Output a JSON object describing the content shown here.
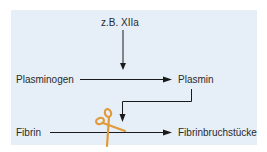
{
  "diagram": {
    "type": "fibrinolysis-pathway",
    "colors": {
      "background": "#e6eff8",
      "line": "#1a1a1a",
      "text": "#2a2a2a",
      "scissors": "#e09a3a"
    },
    "nodes": {
      "activator": "z.B. XIIa",
      "precursor": "Plasminogen",
      "enzyme": "Plasmin",
      "substrate": "Fibrin",
      "product": "Fibrinbruchstücke"
    },
    "edges": [
      {
        "from": "activator",
        "to": "precursor-to-enzyme-arrow",
        "style": "arrow-down"
      },
      {
        "from": "precursor",
        "to": "enzyme",
        "style": "arrow-right"
      },
      {
        "from": "enzyme",
        "to": "substrate-to-product-arrow",
        "style": "elbow-arrow"
      },
      {
        "from": "substrate",
        "to": "product",
        "style": "arrow-right",
        "cut_icon": "scissors-icon"
      }
    ]
  }
}
